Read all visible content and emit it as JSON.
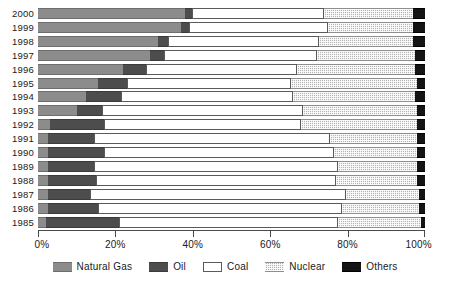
{
  "chart_data": {
    "type": "bar",
    "orientation": "horizontal",
    "stacked": true,
    "normalized_percent": true,
    "title": "",
    "subtitle": "",
    "xlabel": "",
    "ylabel": "",
    "xlim": [
      0,
      100
    ],
    "xticks": [
      0,
      20,
      40,
      60,
      80,
      100
    ],
    "xticklabels": [
      "0%",
      "20%",
      "40%",
      "60%",
      "80%",
      "100%"
    ],
    "grid": false,
    "legend_position": "bottom",
    "categories": [
      "2000",
      "1999",
      "1998",
      "1997",
      "1996",
      "1995",
      "1994",
      "1993",
      "1992",
      "1991",
      "1990",
      "1989",
      "1988",
      "1987",
      "1986",
      "1985"
    ],
    "series": [
      {
        "name": "Natural Gas",
        "color": "#8c8c8c",
        "values": [
          38.0,
          37.0,
          31.0,
          29.0,
          22.0,
          15.5,
          12.5,
          10.0,
          3.0,
          2.5,
          2.5,
          2.5,
          2.5,
          2.5,
          2.5,
          2.0
        ]
      },
      {
        "name": "Oil",
        "color": "#4d4d4d",
        "values": [
          1.8,
          2.0,
          2.5,
          3.5,
          6.0,
          7.5,
          9.0,
          6.5,
          14.0,
          12.0,
          14.5,
          12.0,
          12.5,
          11.0,
          13.0,
          19.0
        ]
      },
      {
        "name": "Coal",
        "color": "#ffffff",
        "values": [
          34.0,
          36.0,
          39.0,
          39.5,
          39.0,
          42.5,
          44.5,
          52.0,
          51.0,
          61.0,
          59.5,
          63.0,
          62.0,
          66.0,
          63.0,
          56.5
        ]
      },
      {
        "name": "Nuclear",
        "color": "#b5b5b5",
        "values": [
          23.0,
          22.0,
          24.5,
          25.5,
          30.5,
          32.5,
          31.5,
          29.5,
          30.0,
          22.5,
          21.5,
          20.5,
          21.0,
          19.0,
          20.0,
          21.5
        ]
      },
      {
        "name": "Others",
        "color": "#141414",
        "values": [
          3.2,
          3.0,
          3.0,
          2.5,
          2.5,
          2.0,
          2.5,
          2.0,
          2.0,
          2.0,
          2.0,
          2.0,
          2.0,
          1.5,
          1.5,
          1.0
        ]
      }
    ]
  },
  "axis": {
    "x_tick_labels": [
      "0%",
      "20%",
      "40%",
      "60%",
      "80%",
      "100%"
    ]
  },
  "legend": {
    "items": [
      {
        "label": "Natural Gas",
        "swatch": "natural-gas-swatch"
      },
      {
        "label": "Oil",
        "swatch": "oil-swatch"
      },
      {
        "label": "Coal",
        "swatch": "coal-swatch"
      },
      {
        "label": "Nuclear",
        "swatch": "nuclear-swatch"
      },
      {
        "label": "Others",
        "swatch": "others-swatch"
      }
    ]
  }
}
